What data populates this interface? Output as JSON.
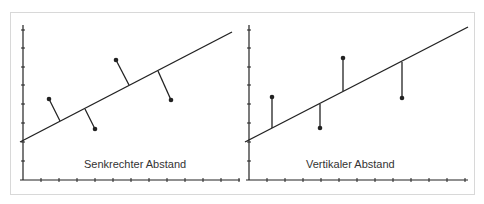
{
  "colors": {
    "ink": "#222222",
    "frame": "#d8d8d8",
    "text": "#333333"
  },
  "panels": [
    {
      "id": "left",
      "caption": "Senkrechter Abstand",
      "distance_type": "perpendicular",
      "regression_line": [
        [
          20,
          142
        ],
        [
          232,
          32
        ]
      ],
      "points": [
        {
          "point": [
            49,
            99
          ],
          "foot": [
            60,
            121
          ]
        },
        {
          "point": [
            95,
            129
          ],
          "foot": [
            85,
            109
          ]
        },
        {
          "point": [
            116,
            60
          ],
          "foot": [
            129,
            85
          ]
        },
        {
          "point": [
            171,
            100
          ],
          "foot": [
            158,
            71
          ]
        }
      ],
      "axes": {
        "origin": [
          23,
          180
        ],
        "x_end": 240,
        "y_top": 25,
        "x_ticks": [
          41,
          59,
          77,
          95,
          113,
          131,
          149,
          167,
          185,
          203,
          221,
          239
        ],
        "y_ticks": [
          30,
          48,
          67,
          85,
          104,
          123,
          142,
          161
        ]
      }
    },
    {
      "id": "right",
      "caption": "Vertikaler Abstand",
      "distance_type": "vertical",
      "regression_line": [
        [
          245,
          142
        ],
        [
          468,
          27
        ]
      ],
      "points": [
        {
          "point": [
            272,
            97
          ],
          "foot": [
            272,
            128
          ]
        },
        {
          "point": [
            320,
            128
          ],
          "foot": [
            320,
            104
          ]
        },
        {
          "point": [
            343,
            58
          ],
          "foot": [
            343,
            91
          ]
        },
        {
          "point": [
            402,
            98
          ],
          "foot": [
            402,
            62
          ]
        }
      ],
      "axes": {
        "origin": [
          249,
          180
        ],
        "x_end": 468,
        "y_top": 25,
        "x_ticks": [
          267,
          285,
          303,
          321,
          339,
          357,
          375,
          393,
          411,
          429,
          447,
          465
        ],
        "y_ticks": [
          30,
          48,
          67,
          85,
          104,
          123,
          142,
          161
        ]
      }
    }
  ]
}
